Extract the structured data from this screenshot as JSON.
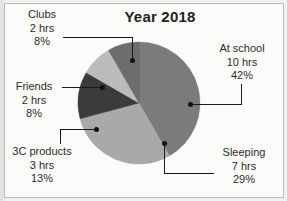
{
  "chart_data": {
    "type": "pie",
    "title": "Year 2018",
    "unit": "hrs",
    "total_hours": 24,
    "categories": [
      "At school",
      "Sleeping",
      "3C products",
      "Friends",
      "Clubs"
    ],
    "values": [
      10,
      7,
      3,
      2,
      2
    ],
    "percentages": [
      42,
      29,
      13,
      8,
      8
    ],
    "colors": [
      "#7b7b7b",
      "#a9a9a9",
      "#3b3b3b",
      "#bcbcbc",
      "#6d6d6d"
    ],
    "legend": "callout-labels",
    "grid": false,
    "slices": [
      {
        "name": "At school",
        "hours_label": "10 hrs",
        "percent_label": "42%",
        "value": 10,
        "percent": 42,
        "color": "#7b7b7b",
        "start_angle": 0,
        "end_angle": 151.2
      },
      {
        "name": "Sleeping",
        "hours_label": "7 hrs",
        "percent_label": "29%",
        "value": 7,
        "percent": 29,
        "color": "#a9a9a9",
        "start_angle": 151.2,
        "end_angle": 255.6
      },
      {
        "name": "3C products",
        "hours_label": "3 hrs",
        "percent_label": "13%",
        "value": 3,
        "percent": 13,
        "color": "#3b3b3b",
        "start_angle": 255.6,
        "end_angle": 302.4
      },
      {
        "name": "Friends",
        "hours_label": "2 hrs",
        "percent_label": "8%",
        "value": 2,
        "percent": 8,
        "color": "#bcbcbc",
        "start_angle": 302.4,
        "end_angle": 331.2
      },
      {
        "name": "Clubs",
        "hours_label": "2 hrs",
        "percent_label": "8%",
        "value": 2,
        "percent": 8,
        "color": "#6d6d6d",
        "start_angle": 331.2,
        "end_angle": 360
      }
    ]
  },
  "labels": {
    "clubs": {
      "name": "Clubs",
      "hours": "2 hrs",
      "percent": "8%"
    },
    "friends": {
      "name": "Friends",
      "hours": "2 hrs",
      "percent": "8%"
    },
    "c3products": {
      "name": "3C products",
      "hours": "3 hrs",
      "percent": "13%"
    },
    "at_school": {
      "name": "At school",
      "hours": "10 hrs",
      "percent": "42%"
    },
    "sleeping": {
      "name": "Sleeping",
      "hours": "7 hrs",
      "percent": "29%"
    }
  }
}
